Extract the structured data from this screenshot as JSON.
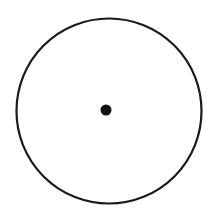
{
  "diagram": {
    "circle": {
      "cx": 109,
      "cy": 111,
      "r": 92.5,
      "stroke": "#1a1a1a",
      "stroke_width": 2.2,
      "fill": "none"
    },
    "center_point": {
      "cx": 106,
      "cy": 110,
      "r": 5.5,
      "fill": "#111111"
    }
  }
}
